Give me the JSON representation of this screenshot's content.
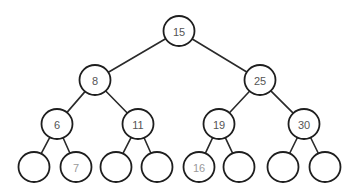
{
  "diagram": {
    "type": "binary-search-tree",
    "colors": {
      "edge": "#2a2a2a",
      "node_stroke": "#1e1e1e",
      "label": "#555555",
      "label_highlight": "#9a9a9a",
      "background": "#ffffff"
    },
    "nodes": [
      {
        "id": "n15",
        "label": "15",
        "x": 179,
        "y": 31,
        "r": 15
      },
      {
        "id": "n8",
        "label": "8",
        "x": 95,
        "y": 80,
        "r": 15
      },
      {
        "id": "n25",
        "label": "25",
        "x": 260,
        "y": 80,
        "r": 15
      },
      {
        "id": "n6",
        "label": "6",
        "x": 57,
        "y": 124,
        "r": 15
      },
      {
        "id": "n11",
        "label": "11",
        "x": 138,
        "y": 124,
        "r": 15
      },
      {
        "id": "n19",
        "label": "19",
        "x": 219,
        "y": 124,
        "r": 15
      },
      {
        "id": "n30",
        "label": "30",
        "x": 304,
        "y": 124,
        "r": 15
      },
      {
        "id": "l1",
        "label": "",
        "x": 34,
        "y": 167,
        "r": 15
      },
      {
        "id": "l7",
        "label": "7",
        "x": 76,
        "y": 167,
        "r": 15,
        "light": true
      },
      {
        "id": "l3",
        "label": "",
        "x": 116,
        "y": 167,
        "r": 15
      },
      {
        "id": "l4",
        "label": "",
        "x": 157,
        "y": 167,
        "r": 15
      },
      {
        "id": "l16",
        "label": "16",
        "x": 199,
        "y": 167,
        "r": 15,
        "light": true
      },
      {
        "id": "l6",
        "label": "",
        "x": 239,
        "y": 167,
        "r": 15
      },
      {
        "id": "l7b",
        "label": "",
        "x": 283,
        "y": 167,
        "r": 15
      },
      {
        "id": "l8",
        "label": "",
        "x": 325,
        "y": 167,
        "r": 15
      }
    ],
    "edges": [
      [
        "n15",
        "n8"
      ],
      [
        "n15",
        "n25"
      ],
      [
        "n8",
        "n6"
      ],
      [
        "n8",
        "n11"
      ],
      [
        "n25",
        "n19"
      ],
      [
        "n25",
        "n30"
      ],
      [
        "n6",
        "l1"
      ],
      [
        "n6",
        "l7"
      ],
      [
        "n11",
        "l3"
      ],
      [
        "n11",
        "l4"
      ],
      [
        "n19",
        "l16"
      ],
      [
        "n19",
        "l6"
      ],
      [
        "n30",
        "l7b"
      ],
      [
        "n30",
        "l8"
      ]
    ]
  }
}
